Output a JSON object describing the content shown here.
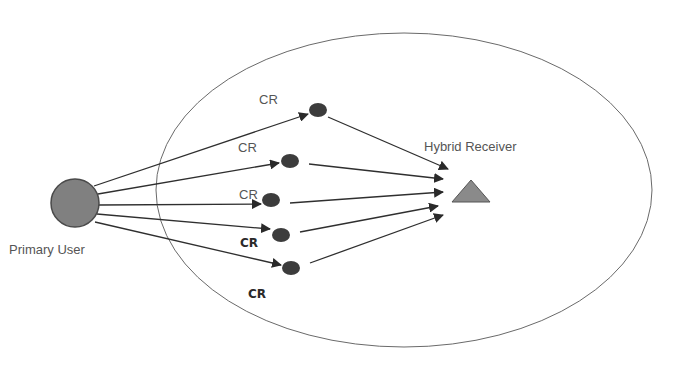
{
  "diagram": {
    "title": "",
    "colors": {
      "background": "#ffffff",
      "line": "#2f2f2f",
      "primary_user_fill": "#808080",
      "primary_user_stroke": "#4a4a4a",
      "cr_node_fill": "#3c3c3c",
      "receiver_fill": "#8a8a8a",
      "receiver_stroke": "#555555",
      "coverage_stroke": "#6a6a6a"
    },
    "coverage_area": {
      "shape": "ellipse",
      "cx": 404,
      "cy": 190,
      "rx": 248,
      "ry": 157
    },
    "primary_user": {
      "label": "Primary User",
      "cx": 75,
      "cy": 203,
      "r": 24,
      "label_x": 9,
      "label_y": 254
    },
    "receiver": {
      "label": "Hybrid Receiver",
      "shape": "triangle",
      "points": "471,180 452,202 490,202",
      "label_x": 424,
      "label_y": 151
    },
    "cr_nodes": [
      {
        "id": "cr1",
        "label": "CR",
        "cx": 318,
        "cy": 110,
        "label_x": 259,
        "label_y": 104,
        "bold": false
      },
      {
        "id": "cr2",
        "label": "CR",
        "cx": 290,
        "cy": 161,
        "label_x": 238,
        "label_y": 152,
        "bold": false
      },
      {
        "id": "cr3",
        "label": "CR",
        "cx": 271,
        "cy": 200,
        "label_x": 239,
        "label_y": 199,
        "bold": false
      },
      {
        "id": "cr4",
        "label": "CR",
        "cx": 281,
        "cy": 235,
        "label_x": 240,
        "label_y": 247,
        "bold": true
      },
      {
        "id": "cr5",
        "label": "CR",
        "cx": 291,
        "cy": 268,
        "label_x": 248,
        "label_y": 298,
        "bold": true
      }
    ],
    "edges_primary_to_cr": [
      {
        "from": "primary_user",
        "to": "cr1",
        "x1": 94,
        "y1": 186,
        "x2": 308,
        "y2": 114
      },
      {
        "from": "primary_user",
        "to": "cr2",
        "x1": 98,
        "y1": 194,
        "x2": 279,
        "y2": 163
      },
      {
        "from": "primary_user",
        "to": "cr3",
        "x1": 99,
        "y1": 205,
        "x2": 261,
        "y2": 204
      },
      {
        "from": "primary_user",
        "to": "cr4",
        "x1": 97,
        "y1": 214,
        "x2": 270,
        "y2": 229
      },
      {
        "from": "primary_user",
        "to": "cr5",
        "x1": 95,
        "y1": 222,
        "x2": 281,
        "y2": 265
      }
    ],
    "edges_cr_to_receiver": [
      {
        "from": "cr1",
        "to": "receiver",
        "x1": 328,
        "y1": 117,
        "x2": 448,
        "y2": 169
      },
      {
        "from": "cr2",
        "to": "receiver",
        "x1": 309,
        "y1": 164,
        "x2": 443,
        "y2": 179
      },
      {
        "from": "cr3",
        "to": "receiver",
        "x1": 290,
        "y1": 203,
        "x2": 443,
        "y2": 192
      },
      {
        "from": "cr4",
        "to": "receiver",
        "x1": 300,
        "y1": 232,
        "x2": 438,
        "y2": 206
      },
      {
        "from": "cr5",
        "to": "receiver",
        "x1": 310,
        "y1": 263,
        "x2": 443,
        "y2": 215
      }
    ]
  }
}
